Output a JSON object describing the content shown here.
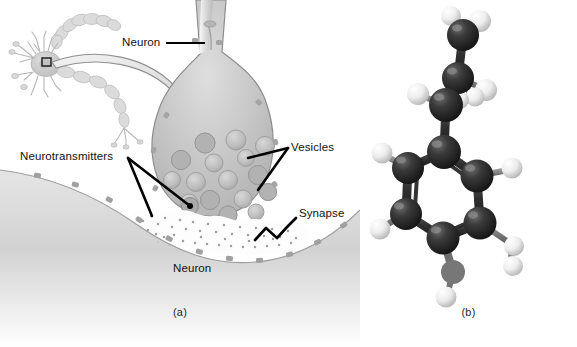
{
  "figure": {
    "background_color": "#ffffff",
    "panels": [
      {
        "id": "a",
        "caption": "(a)",
        "subject": "synapse-illustration"
      },
      {
        "id": "b",
        "caption": "(b)",
        "subject": "ball-and-stick-molecule"
      }
    ]
  },
  "panel_a": {
    "caption": "(a)",
    "labels": [
      {
        "key": "neuron_presynaptic",
        "text": "Neuron"
      },
      {
        "key": "neurotransmitters",
        "text": "Neurotransmitters"
      },
      {
        "key": "vesicles",
        "text": "Vesicles"
      },
      {
        "key": "synapse",
        "text": "Synapse"
      },
      {
        "key": "neuron_postsynaptic",
        "text": "Neuron"
      }
    ],
    "neuron_label": "Neuron",
    "neurotransmitters_label": "Neurotransmitters",
    "vesicles_label": "Vesicles",
    "synapse_label": "Synapse",
    "neuron_label_bottom": "Neuron",
    "colors": {
      "leader_line": "#000000",
      "terminal_fill": "#c9c9c9",
      "terminal_stroke": "#8e8e8e",
      "vesicle_fill": "#bdbdbd",
      "vesicle_stroke": "#9a9a9a",
      "postsynaptic_fill": "#d2d2d2",
      "receptor": "#a5a5a5",
      "arrow_fill": "#e4e4e4",
      "arrow_stroke": "#9b9b9b",
      "inset_neuron": "#cfcfcf",
      "inset_box_stroke": "#000000"
    },
    "icons": [
      "neuron-cell-icon",
      "curved-magnify-arrow-icon",
      "axon-terminal-icon",
      "vesicle-icon",
      "neurotransmitter-particles-icon",
      "receptor-icon",
      "synapse-bracket-icon"
    ],
    "counts": {
      "vesicles_drawn": 16,
      "receptors_drawn": 14
    }
  },
  "panel_b": {
    "caption": "(b)",
    "model_type": "ball-and-stick",
    "colors": {
      "carbon": "#2b2b2b",
      "hydrogen": "#f2f2f2",
      "bond": "#3a3a3a",
      "bond_light": "#6e6e6e",
      "highlight": "#ffffff",
      "shadow": "#0d0d0d"
    },
    "atoms": {
      "carbon_label": "C",
      "hydrogen_label": "H"
    },
    "counts": {
      "carbon_atoms": 9,
      "hydrogen_atoms": 13
    },
    "structure": "benzene ring with ethyl/amine side chain"
  }
}
